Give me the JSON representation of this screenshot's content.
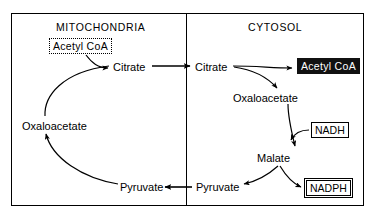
{
  "diagram": {
    "compartments": [
      {
        "id": "mitochondria",
        "label": "MITOCHONDRIA"
      },
      {
        "id": "cytosol",
        "label": "CYTOSOL"
      }
    ],
    "nodes": {
      "acetyl_coa_mito": {
        "label": "Acetyl CoA",
        "style": "dotted-box",
        "compartment": "mitochondria"
      },
      "citrate_mito": {
        "label": "Citrate",
        "style": "plain",
        "compartment": "mitochondria"
      },
      "oxaloacetate_mito": {
        "label": "Oxaloacetate",
        "style": "plain",
        "compartment": "mitochondria"
      },
      "pyruvate_mito": {
        "label": "Pyruvate",
        "style": "plain",
        "compartment": "mitochondria"
      },
      "citrate_cyto": {
        "label": "Citrate",
        "style": "plain",
        "compartment": "cytosol"
      },
      "acetyl_coa_cyto": {
        "label": "Acetyl CoA",
        "style": "inverted-box",
        "compartment": "cytosol"
      },
      "oxaloacetate_cyto": {
        "label": "Oxaloacetate",
        "style": "plain",
        "compartment": "cytosol"
      },
      "nadh": {
        "label": "NADH",
        "style": "boxed",
        "compartment": "cytosol"
      },
      "malate": {
        "label": "Malate",
        "style": "plain",
        "compartment": "cytosol"
      },
      "nadph": {
        "label": "NADPH",
        "style": "double-boxed",
        "compartment": "cytosol"
      },
      "pyruvate_cyto": {
        "label": "Pyruvate",
        "style": "plain",
        "compartment": "cytosol"
      }
    },
    "edges": [
      {
        "from": "acetyl_coa_mito",
        "to": "citrate_mito",
        "kind": "curved"
      },
      {
        "from": "oxaloacetate_mito",
        "to": "citrate_mito",
        "kind": "curved"
      },
      {
        "from": "citrate_mito",
        "to": "citrate_cyto",
        "kind": "straight-transport"
      },
      {
        "from": "citrate_cyto",
        "to": "acetyl_coa_cyto",
        "kind": "curved"
      },
      {
        "from": "citrate_cyto",
        "to": "oxaloacetate_cyto",
        "kind": "curved"
      },
      {
        "from": "oxaloacetate_cyto",
        "to": "malate",
        "kind": "curved"
      },
      {
        "from": "nadh",
        "to": "malate",
        "kind": "curved-cofactor"
      },
      {
        "from": "malate",
        "to": "pyruvate_cyto",
        "kind": "curved"
      },
      {
        "from": "malate",
        "to": "nadph",
        "kind": "curved-cofactor"
      },
      {
        "from": "pyruvate_cyto",
        "to": "pyruvate_mito",
        "kind": "straight-transport"
      },
      {
        "from": "pyruvate_mito",
        "to": "oxaloacetate_mito",
        "kind": "curved"
      }
    ],
    "colors": {
      "stroke": "#000000",
      "background": "#ffffff",
      "inverted_fill": "#111111",
      "inverted_text": "#ffffff"
    }
  }
}
